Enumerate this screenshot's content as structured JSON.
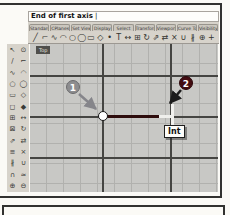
{
  "window": {
    "command_prompt": "End of first axis",
    "command_cursor": "|"
  },
  "tabs": [
    {
      "name": "tab-standard",
      "label": "Standard"
    },
    {
      "name": "tab-cplanes",
      "label": "CPlanes"
    },
    {
      "name": "tab-set-view",
      "label": "Set View"
    },
    {
      "name": "tab-display",
      "label": "Display"
    },
    {
      "name": "tab-select",
      "label": "Select"
    },
    {
      "name": "tab-transform",
      "label": "Transform"
    },
    {
      "name": "tab-viewport-layout",
      "label": "Viewport Layout"
    },
    {
      "name": "tab-curve-tools",
      "label": "Curve Tools"
    },
    {
      "name": "tab-visibility",
      "label": "Visibility"
    }
  ],
  "toolbar": {
    "icons": [
      {
        "name": "line-icon",
        "glyph": "╱"
      },
      {
        "name": "polyline-icon",
        "glyph": "⌐"
      },
      {
        "name": "curve-icon",
        "glyph": "∿"
      },
      {
        "name": "arc-icon",
        "glyph": "◠"
      },
      {
        "name": "circle-icon",
        "glyph": "○"
      },
      {
        "name": "ellipse-icon",
        "glyph": "◯"
      },
      {
        "name": "rectangle-icon",
        "glyph": "▭"
      },
      {
        "name": "polygon-icon",
        "glyph": "◇"
      },
      {
        "name": "point-icon",
        "glyph": "•"
      },
      {
        "name": "text-icon",
        "glyph": "T"
      },
      {
        "name": "move-icon",
        "glyph": "↔"
      },
      {
        "name": "copy-icon",
        "glyph": "⊞"
      },
      {
        "name": "rotate-icon",
        "glyph": "↻"
      },
      {
        "name": "scale-icon",
        "glyph": "⇗"
      },
      {
        "name": "mirror-icon",
        "glyph": "⇄"
      },
      {
        "name": "trim-icon",
        "glyph": "×"
      },
      {
        "name": "join-icon",
        "glyph": "∪"
      },
      {
        "name": "split-icon",
        "glyph": "∦"
      },
      {
        "name": "zoom-icon",
        "glyph": "⊕"
      },
      {
        "name": "pan-icon",
        "glyph": "+"
      }
    ]
  },
  "side_toolbar": {
    "icons": [
      {
        "name": "select-icon",
        "glyph": "↖"
      },
      {
        "name": "point-icon",
        "glyph": "⊙"
      },
      {
        "name": "line-icon",
        "glyph": "∕"
      },
      {
        "name": "polyline-icon",
        "glyph": "⌐"
      },
      {
        "name": "curve-icon",
        "glyph": "∿"
      },
      {
        "name": "arc-icon",
        "glyph": "◠"
      },
      {
        "name": "circle-icon",
        "glyph": "○"
      },
      {
        "name": "ellipse-icon",
        "glyph": "◯"
      },
      {
        "name": "rectangle-icon",
        "glyph": "▭"
      },
      {
        "name": "polygon-icon",
        "glyph": "◇"
      },
      {
        "name": "surface-icon",
        "glyph": "◻"
      },
      {
        "name": "solid-icon",
        "glyph": "◆"
      },
      {
        "name": "mesh-icon",
        "glyph": "⊞"
      },
      {
        "name": "move-icon",
        "glyph": "↔"
      },
      {
        "name": "copy-icon",
        "glyph": "⊠"
      },
      {
        "name": "rotate-icon",
        "glyph": "↻"
      },
      {
        "name": "scale-icon",
        "glyph": "⇗"
      },
      {
        "name": "mirror-icon",
        "glyph": "⇄"
      },
      {
        "name": "array-icon",
        "glyph": "≡"
      },
      {
        "name": "trim-icon",
        "glyph": "×"
      },
      {
        "name": "split-icon",
        "glyph": "∦"
      },
      {
        "name": "join-icon",
        "glyph": "∪"
      },
      {
        "name": "fillet-icon",
        "glyph": "∩"
      },
      {
        "name": "offset-icon",
        "glyph": "≈"
      },
      {
        "name": "zoom-icon",
        "glyph": "⊕"
      },
      {
        "name": "hide-icon",
        "glyph": "⊖"
      }
    ]
  },
  "viewport": {
    "title": "Top",
    "osnap_tooltip": "Int",
    "callout_1": "1",
    "callout_2": "2"
  },
  "colors": {
    "axis_line": "#2e0d0d",
    "balloon_1": "#8d8d8f",
    "balloon_2": "#430d12",
    "canvas_bg": "#c8c8c5",
    "frame_border": "#323230"
  }
}
